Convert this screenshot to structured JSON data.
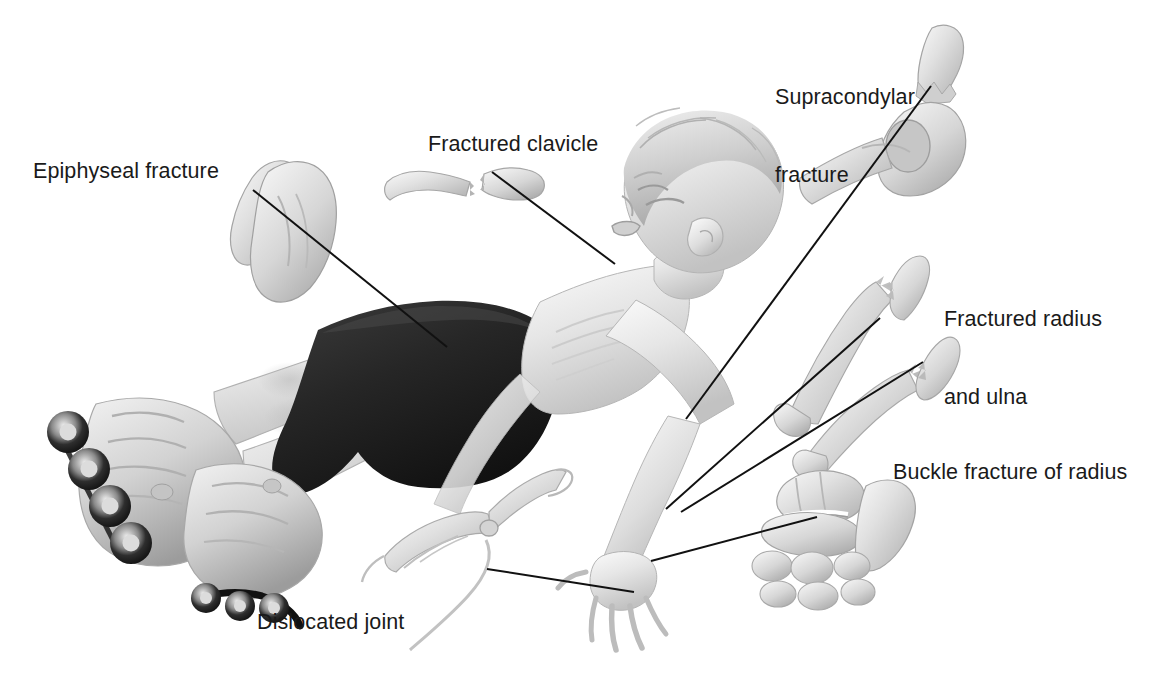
{
  "figure": {
    "background_color": "#ffffff",
    "ink_color": "#1a1a1a",
    "style": "grayscale pencil medical illustration",
    "width": 1151,
    "height": 679
  },
  "labels": {
    "epiphyseal": "Epiphyseal fracture",
    "clavicle": "Fractured clavicle",
    "supracondylar_line1": "Supracondylar",
    "supracondylar_line2": "fracture",
    "radius_ulna_line1": "Fractured radius",
    "radius_ulna_line2": "and ulna",
    "buckle": "Buckle fracture of radius",
    "dislocated": "Dislocated joint"
  },
  "callouts": [
    {
      "id": "epiphyseal",
      "label": "Epiphyseal fracture",
      "inset": "proximal-femur-with-separated-epiphysis",
      "leader_from": [
        253,
        190
      ],
      "leader_to": [
        447,
        347
      ]
    },
    {
      "id": "clavicle",
      "label": "Fractured clavicle",
      "inset": "clavicle-broken-in-two-pieces",
      "leader_from": [
        492,
        172
      ],
      "leader_to": [
        615,
        264
      ]
    },
    {
      "id": "supracondylar",
      "label": "Supracondylar fracture",
      "inset": "elbow-with-humerus-fracture-above-condyles",
      "leader_from": [
        931,
        86
      ],
      "leader_to": [
        686,
        419
      ]
    },
    {
      "id": "radius",
      "label": "Fractured radius and ulna",
      "inset": "radius-bone-with-jagged-break",
      "leader_from": [
        880,
        318
      ],
      "leader_to": [
        666,
        509
      ]
    },
    {
      "id": "ulna",
      "label": "Fractured radius and ulna",
      "inset": "ulna-bone-with-jagged-break",
      "leader_from": [
        923,
        362
      ],
      "leader_to": [
        681,
        512
      ]
    },
    {
      "id": "buckle",
      "label": "Buckle fracture of radius",
      "inset": "wrist-with-buckled-distal-radius-and-carpals",
      "leader_from": [
        817,
        517
      ],
      "leader_to": [
        651,
        561
      ]
    },
    {
      "id": "dislocated",
      "label": "Dislocated joint",
      "inset": "finger-with-dislocated-interphalangeal-joint",
      "leader_from": [
        487,
        569
      ],
      "leader_to": [
        634,
        592
      ]
    }
  ],
  "subject": {
    "description": "Boy falling backward wearing dark shorts and inline skates",
    "shorts_color": "#2b2b2b",
    "skate_wheels_per_skate": 4
  }
}
